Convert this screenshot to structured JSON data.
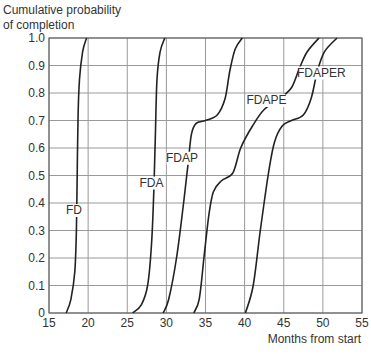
{
  "chart_data": {
    "type": "line",
    "title": "",
    "ylabel": "Cumulative probability of completion",
    "ylabel_lines": [
      "Cumulative probability",
      "of completion"
    ],
    "xlabel": "Months from start",
    "xlim": [
      15,
      55
    ],
    "ylim": [
      0,
      1.0
    ],
    "x_ticks": [
      15,
      20,
      25,
      30,
      35,
      40,
      45,
      50,
      55
    ],
    "y_ticks": [
      0,
      0.1,
      0.2,
      0.3,
      0.4,
      0.5,
      0.6,
      0.7,
      0.8,
      0.9,
      1.0
    ],
    "y_tick_labels": [
      "0",
      "0.1",
      "0.2",
      "0.3",
      "0.4",
      "0.5",
      "0.6",
      "0.7",
      "0.8",
      "0.9",
      "1.0"
    ],
    "grid": true,
    "legend": "inline labels",
    "series": [
      {
        "name": "FD",
        "label_pos": [
          18.2,
          0.36
        ],
        "points": [
          [
            17.2,
            0
          ],
          [
            17.8,
            0.05
          ],
          [
            18.3,
            0.15
          ],
          [
            18.5,
            0.3
          ],
          [
            18.6,
            0.5
          ],
          [
            18.7,
            0.7
          ],
          [
            18.9,
            0.85
          ],
          [
            19.3,
            0.95
          ],
          [
            19.8,
            1.0
          ]
        ]
      },
      {
        "name": "FDA",
        "label_pos": [
          28.1,
          0.46
        ],
        "points": [
          [
            25.7,
            0
          ],
          [
            26.8,
            0.03
          ],
          [
            27.6,
            0.1
          ],
          [
            28.1,
            0.25
          ],
          [
            28.4,
            0.45
          ],
          [
            28.6,
            0.65
          ],
          [
            28.8,
            0.85
          ],
          [
            29.2,
            0.95
          ],
          [
            29.8,
            1.0
          ]
        ]
      },
      {
        "name": "FDAP",
        "label_pos": [
          32.0,
          0.55
        ],
        "points": [
          [
            29.6,
            0
          ],
          [
            30.3,
            0.05
          ],
          [
            31.3,
            0.2
          ],
          [
            32.2,
            0.4
          ],
          [
            32.8,
            0.55
          ],
          [
            33.2,
            0.65
          ],
          [
            33.8,
            0.69
          ],
          [
            35,
            0.7
          ],
          [
            36.5,
            0.72
          ],
          [
            37.5,
            0.78
          ],
          [
            38.1,
            0.88
          ],
          [
            38.8,
            0.96
          ],
          [
            39.7,
            1.0
          ]
        ]
      },
      {
        "name": "FDAPE",
        "label_pos": [
          42.8,
          0.76
        ],
        "points": [
          [
            33.5,
            0
          ],
          [
            34.2,
            0.05
          ],
          [
            34.8,
            0.2
          ],
          [
            35.4,
            0.35
          ],
          [
            36.0,
            0.44
          ],
          [
            37,
            0.48
          ],
          [
            38.5,
            0.51
          ],
          [
            39.5,
            0.6
          ],
          [
            41,
            0.68
          ],
          [
            42.5,
            0.74
          ],
          [
            44.5,
            0.78
          ],
          [
            46,
            0.82
          ],
          [
            47,
            0.89
          ],
          [
            48,
            0.95
          ],
          [
            49.5,
            1.0
          ]
        ]
      },
      {
        "name": "FDAPER",
        "label_pos": [
          49.8,
          0.86
        ],
        "points": [
          [
            40.1,
            0
          ],
          [
            41.1,
            0.1
          ],
          [
            42,
            0.3
          ],
          [
            43,
            0.5
          ],
          [
            43.8,
            0.62
          ],
          [
            44.8,
            0.68
          ],
          [
            46,
            0.7
          ],
          [
            47.5,
            0.72
          ],
          [
            48.5,
            0.78
          ],
          [
            49.3,
            0.88
          ],
          [
            50.2,
            0.95
          ],
          [
            51.8,
            1.0
          ]
        ]
      }
    ]
  },
  "labels": {
    "ylabel_line1": "Cumulative probability",
    "ylabel_line2": "of completion",
    "xlabel": "Months from start"
  }
}
